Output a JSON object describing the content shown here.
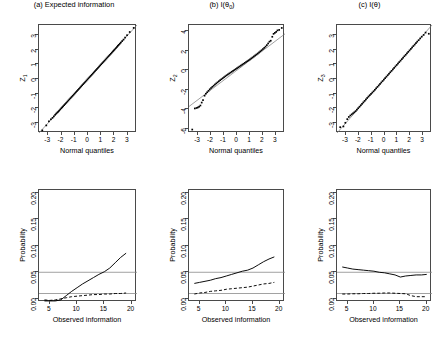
{
  "figure": {
    "panels_across": 3,
    "panels_down": 2,
    "background": "#ffffff",
    "line_color": "#000000",
    "reference_line_color": "#8a8a8a",
    "axis_color": "#4a4a4a"
  },
  "chart_data": [
    {
      "id": "panel-a",
      "type": "scatter",
      "title": "(a) Expected information",
      "xlabel": "Normal quantiles",
      "ylabel": "Z",
      "ylabel_sub": "1",
      "xlim": [
        -3.7,
        3.7
      ],
      "ylim": [
        -3.7,
        3.7
      ],
      "xticks": [
        -3,
        -2,
        -1,
        0,
        1,
        2,
        3
      ],
      "yticks": [
        -3,
        -2,
        -1,
        0,
        1,
        2,
        3
      ],
      "grid": false,
      "reference_line": {
        "type": "identity",
        "slope": 1,
        "intercept": 0
      },
      "points_x": [
        -3.45,
        -3.15,
        -2.95,
        -2.8,
        -2.68,
        -2.58,
        -2.48,
        -2.4,
        -2.32,
        -2.25,
        -2.18,
        -2.1,
        -2.02,
        -1.95,
        -1.88,
        -1.8,
        -1.72,
        -1.64,
        -1.56,
        -1.48,
        -1.4,
        -1.32,
        -1.24,
        -1.16,
        -1.08,
        -1.0,
        -0.92,
        -0.84,
        -0.76,
        -0.68,
        -0.6,
        -0.52,
        -0.44,
        -0.36,
        -0.28,
        -0.2,
        -0.12,
        -0.04,
        0.04,
        0.12,
        0.2,
        0.28,
        0.36,
        0.44,
        0.52,
        0.6,
        0.68,
        0.76,
        0.84,
        0.92,
        1.0,
        1.08,
        1.16,
        1.24,
        1.32,
        1.4,
        1.48,
        1.56,
        1.64,
        1.72,
        1.8,
        1.88,
        1.95,
        2.02,
        2.1,
        2.18,
        2.25,
        2.32,
        2.4,
        2.48,
        2.58,
        2.68,
        2.8,
        2.95,
        3.15,
        3.45
      ],
      "points_y": [
        -3.52,
        -3.18,
        -2.9,
        -2.76,
        -2.66,
        -2.56,
        -2.45,
        -2.37,
        -2.3,
        -2.24,
        -2.17,
        -2.09,
        -2.01,
        -1.94,
        -1.87,
        -1.79,
        -1.71,
        -1.63,
        -1.55,
        -1.47,
        -1.39,
        -1.31,
        -1.23,
        -1.15,
        -1.07,
        -0.99,
        -0.91,
        -0.83,
        -0.75,
        -0.67,
        -0.59,
        -0.51,
        -0.43,
        -0.35,
        -0.27,
        -0.19,
        -0.11,
        -0.03,
        0.05,
        0.13,
        0.21,
        0.29,
        0.37,
        0.45,
        0.53,
        0.61,
        0.69,
        0.77,
        0.85,
        0.93,
        1.01,
        1.09,
        1.17,
        1.25,
        1.33,
        1.41,
        1.49,
        1.57,
        1.65,
        1.73,
        1.81,
        1.89,
        1.96,
        2.03,
        2.11,
        2.19,
        2.27,
        2.34,
        2.42,
        2.5,
        2.6,
        2.7,
        2.84,
        3.0,
        3.22,
        3.5
      ]
    },
    {
      "id": "panel-b",
      "type": "scatter",
      "title_prefix": "(b) I(",
      "title_theta": "θ",
      "title_sub": "0",
      "title_suffix": ")",
      "title": "(b) I(θ₀)",
      "xlabel": "Normal quantiles",
      "ylabel": "Z",
      "ylabel_sub": "2",
      "xlim": [
        -3.7,
        3.7
      ],
      "ylim": [
        -6.4,
        4.6
      ],
      "xticks": [
        -3,
        -2,
        -1,
        0,
        1,
        2,
        3
      ],
      "yticks": [
        -6,
        -4,
        -2,
        0,
        2,
        4
      ],
      "grid": false,
      "reference_line": {
        "type": "identity",
        "slope": 1,
        "intercept": 0
      },
      "points_x": [
        -3.45,
        -3.25,
        -3.12,
        -3.02,
        -2.92,
        -2.82,
        -2.72,
        -2.62,
        -2.5,
        -2.4,
        -2.3,
        -2.2,
        -2.1,
        -2.0,
        -1.9,
        -1.8,
        -1.7,
        -1.6,
        -1.5,
        -1.4,
        -1.3,
        -1.2,
        -1.1,
        -1.0,
        -0.9,
        -0.8,
        -0.7,
        -0.6,
        -0.5,
        -0.4,
        -0.3,
        -0.2,
        -0.1,
        0.0,
        0.1,
        0.2,
        0.3,
        0.4,
        0.5,
        0.6,
        0.7,
        0.8,
        0.9,
        1.0,
        1.1,
        1.2,
        1.3,
        1.4,
        1.5,
        1.6,
        1.7,
        1.8,
        1.9,
        2.0,
        2.1,
        2.2,
        2.3,
        2.4,
        2.5,
        2.6,
        2.72,
        2.82,
        2.92,
        3.02,
        3.12,
        3.25,
        3.45
      ],
      "points_y": [
        -6.05,
        -3.9,
        -3.85,
        -3.8,
        -3.72,
        -3.6,
        -3.3,
        -3.05,
        -2.6,
        -2.4,
        -2.25,
        -2.1,
        -1.95,
        -1.82,
        -1.7,
        -1.58,
        -1.46,
        -1.35,
        -1.24,
        -1.13,
        -1.02,
        -0.92,
        -0.82,
        -0.72,
        -0.62,
        -0.52,
        -0.43,
        -0.34,
        -0.25,
        -0.16,
        -0.07,
        0.02,
        0.11,
        0.2,
        0.29,
        0.38,
        0.47,
        0.56,
        0.65,
        0.74,
        0.83,
        0.92,
        1.01,
        1.1,
        1.2,
        1.3,
        1.4,
        1.5,
        1.6,
        1.7,
        1.81,
        1.92,
        2.03,
        2.15,
        2.27,
        2.4,
        2.55,
        2.72,
        2.9,
        3.0,
        3.4,
        3.7,
        3.8,
        3.9,
        4.05,
        4.1,
        4.3
      ]
    },
    {
      "id": "panel-c",
      "type": "scatter",
      "title_prefix": "(c) I(",
      "title_theta": "θ",
      "title_hat": "ˆ",
      "title_suffix": ")",
      "title": "(c) I(θ̂)",
      "xlabel": "Normal quantiles",
      "ylabel": "Z",
      "ylabel_sub": "3",
      "xlim": [
        -3.7,
        3.7
      ],
      "ylim": [
        -3.7,
        3.7
      ],
      "xticks": [
        -3,
        -2,
        -1,
        0,
        1,
        2,
        3
      ],
      "yticks": [
        -3,
        -2,
        -1,
        0,
        1,
        2,
        3
      ],
      "grid": false,
      "reference_line": {
        "type": "identity",
        "slope": 1,
        "intercept": 0
      },
      "points_x": [
        -3.45,
        -3.2,
        -3.05,
        -2.9,
        -2.78,
        -2.66,
        -2.55,
        -2.45,
        -2.35,
        -2.25,
        -2.15,
        -2.05,
        -1.95,
        -1.85,
        -1.75,
        -1.65,
        -1.55,
        -1.45,
        -1.35,
        -1.25,
        -1.15,
        -1.05,
        -0.95,
        -0.85,
        -0.75,
        -0.65,
        -0.55,
        -0.45,
        -0.35,
        -0.25,
        -0.15,
        -0.05,
        0.05,
        0.15,
        0.25,
        0.35,
        0.45,
        0.55,
        0.65,
        0.75,
        0.85,
        0.95,
        1.05,
        1.15,
        1.25,
        1.35,
        1.45,
        1.55,
        1.65,
        1.75,
        1.85,
        1.95,
        2.05,
        2.15,
        2.25,
        2.35,
        2.45,
        2.55,
        2.66,
        2.78,
        2.9,
        3.05,
        3.2,
        3.45
      ],
      "points_y": [
        -3.3,
        -3.25,
        -3.0,
        -2.75,
        -2.6,
        -2.5,
        -2.42,
        -2.35,
        -2.28,
        -2.2,
        -2.1,
        -2.0,
        -1.9,
        -1.8,
        -1.7,
        -1.6,
        -1.5,
        -1.4,
        -1.3,
        -1.2,
        -1.11,
        -1.02,
        -0.93,
        -0.84,
        -0.74,
        -0.64,
        -0.54,
        -0.44,
        -0.34,
        -0.24,
        -0.14,
        -0.04,
        0.06,
        0.16,
        0.26,
        0.36,
        0.46,
        0.56,
        0.66,
        0.76,
        0.86,
        0.96,
        1.06,
        1.16,
        1.26,
        1.36,
        1.46,
        1.56,
        1.66,
        1.76,
        1.86,
        1.96,
        2.06,
        2.16,
        2.26,
        2.36,
        2.46,
        2.56,
        2.66,
        2.78,
        2.9,
        3.02,
        3.18,
        3.1
      ]
    },
    {
      "id": "panel-d",
      "type": "line",
      "title": "",
      "xlabel": "Observed information",
      "ylabel": "Probability",
      "xlim": [
        3,
        21
      ],
      "ylim": [
        -0.006,
        0.205
      ],
      "xticks": [
        5,
        10,
        15,
        20
      ],
      "yticks": [
        0.0,
        0.05,
        0.1,
        0.15,
        0.2
      ],
      "ytick_labels": [
        "0.00",
        "0.05",
        "0.10",
        "0.15",
        "0.20"
      ],
      "grid": false,
      "hlines": [
        0.05,
        0.01
      ],
      "series": [
        {
          "name": "solid",
          "style": "solid",
          "x": [
            4,
            5,
            6,
            7,
            8,
            9,
            10,
            11,
            12,
            13,
            14,
            15,
            16,
            17,
            18,
            19
          ],
          "y": [
            -0.004,
            -0.004,
            -0.004,
            -0.002,
            0.006,
            0.014,
            0.021,
            0.028,
            0.034,
            0.04,
            0.046,
            0.051,
            0.058,
            0.068,
            0.078,
            0.086
          ]
        },
        {
          "name": "dashed",
          "style": "dashed",
          "x": [
            4,
            5,
            6,
            7,
            8,
            9,
            10,
            11,
            12,
            13,
            14,
            15,
            16,
            17,
            18,
            19
          ],
          "y": [
            -0.002,
            -0.003,
            -0.002,
            0.0,
            0.002,
            0.004,
            0.005,
            0.006,
            0.007,
            0.008,
            0.008,
            0.009,
            0.009,
            0.01,
            0.01,
            0.011
          ]
        }
      ]
    },
    {
      "id": "panel-e",
      "type": "line",
      "title": "",
      "xlabel": "Observed information",
      "ylabel": "Probability",
      "xlim": [
        3,
        21
      ],
      "ylim": [
        -0.006,
        0.205
      ],
      "xticks": [
        5,
        10,
        15,
        20
      ],
      "yticks": [
        0.0,
        0.05,
        0.1,
        0.15,
        0.2
      ],
      "ytick_labels": [
        "0.00",
        "0.05",
        "0.10",
        "0.15",
        "0.20"
      ],
      "grid": false,
      "hlines": [
        0.05,
        0.01
      ],
      "series": [
        {
          "name": "solid",
          "style": "solid",
          "x": [
            4,
            5,
            6,
            7,
            8,
            9,
            10,
            11,
            12,
            13,
            14,
            15,
            16,
            17,
            18,
            19
          ],
          "y": [
            0.029,
            0.031,
            0.033,
            0.035,
            0.038,
            0.04,
            0.043,
            0.046,
            0.049,
            0.052,
            0.054,
            0.058,
            0.064,
            0.07,
            0.075,
            0.079
          ]
        },
        {
          "name": "dashed",
          "style": "dashed",
          "x": [
            4,
            5,
            6,
            7,
            8,
            9,
            10,
            11,
            12,
            13,
            14,
            15,
            16,
            17,
            18,
            19
          ],
          "y": [
            0.009,
            0.011,
            0.012,
            0.014,
            0.015,
            0.016,
            0.018,
            0.019,
            0.02,
            0.021,
            0.022,
            0.024,
            0.026,
            0.028,
            0.029,
            0.031
          ]
        }
      ]
    },
    {
      "id": "panel-f",
      "type": "line",
      "title": "",
      "xlabel": "Observed information",
      "ylabel": "Probability",
      "xlim": [
        3,
        21
      ],
      "ylim": [
        -0.006,
        0.205
      ],
      "xticks": [
        5,
        10,
        15,
        20
      ],
      "yticks": [
        0.0,
        0.05,
        0.1,
        0.15,
        0.2
      ],
      "ytick_labels": [
        "0.00",
        "0.05",
        "0.10",
        "0.15",
        "0.20"
      ],
      "grid": false,
      "hlines": [
        0.05,
        0.01
      ],
      "series": [
        {
          "name": "solid",
          "style": "solid",
          "x": [
            4,
            5,
            6,
            7,
            8,
            9,
            10,
            11,
            12,
            13,
            14,
            15,
            16,
            17,
            18,
            19,
            20
          ],
          "y": [
            0.06,
            0.058,
            0.056,
            0.055,
            0.054,
            0.053,
            0.052,
            0.05,
            0.049,
            0.047,
            0.045,
            0.041,
            0.043,
            0.044,
            0.045,
            0.045,
            0.046
          ]
        },
        {
          "name": "dashed",
          "style": "dashed",
          "x": [
            4,
            5,
            6,
            7,
            8,
            9,
            10,
            11,
            12,
            13,
            14,
            15,
            16,
            17,
            18,
            19,
            20
          ],
          "y": [
            0.009,
            0.009,
            0.0095,
            0.0095,
            0.01,
            0.01,
            0.0105,
            0.0105,
            0.011,
            0.011,
            0.0105,
            0.01,
            0.0095,
            0.006,
            0.004,
            0.004,
            0.004
          ]
        }
      ]
    }
  ]
}
